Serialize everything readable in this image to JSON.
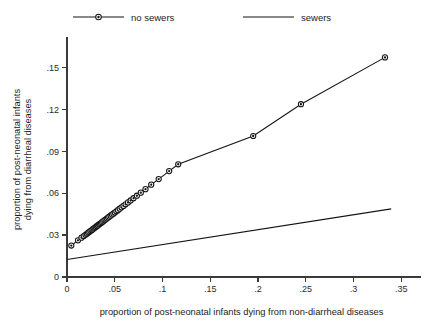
{
  "chart_data": {
    "type": "scatter",
    "title": "",
    "xlabel": "proportion of post-neonatal infants dying from non-diarrheal diseases",
    "ylabel_line1": "proportion of post-neonatal infants",
    "ylabel_line2": "dying from diarrheal diseases",
    "xlim": [
      0,
      0.355
    ],
    "ylim": [
      0,
      0.168
    ],
    "grid": false,
    "legend_position": "top",
    "xticks": [
      0,
      0.05,
      0.1,
      0.15,
      0.2,
      0.25,
      0.3,
      0.35
    ],
    "xtick_labels": [
      "0",
      ".05",
      ".1",
      ".15",
      ".2",
      ".25",
      ".3",
      ".35"
    ],
    "yticks": [
      0,
      0.03,
      0.06,
      0.09,
      0.12,
      0.15
    ],
    "ytick_labels": [
      "0",
      ".03",
      ".06",
      ".09",
      ".12",
      ".15"
    ],
    "series": [
      {
        "name": "no sewers",
        "marker": "circle-dot",
        "line": true,
        "color": "#141414",
        "points": [
          [
            0.0045,
            0.0225
          ],
          [
            0.0115,
            0.0262
          ],
          [
            0.0152,
            0.0281
          ],
          [
            0.0176,
            0.0293
          ],
          [
            0.0194,
            0.0302
          ],
          [
            0.0208,
            0.0309
          ],
          [
            0.0221,
            0.0316
          ],
          [
            0.0233,
            0.0322
          ],
          [
            0.0245,
            0.0328
          ],
          [
            0.0257,
            0.0334
          ],
          [
            0.0268,
            0.034
          ],
          [
            0.0279,
            0.0346
          ],
          [
            0.029,
            0.0352
          ],
          [
            0.0301,
            0.0357
          ],
          [
            0.0312,
            0.0363
          ],
          [
            0.0323,
            0.0369
          ],
          [
            0.0334,
            0.0375
          ],
          [
            0.0345,
            0.038
          ],
          [
            0.0356,
            0.0386
          ],
          [
            0.0368,
            0.0392
          ],
          [
            0.038,
            0.0398
          ],
          [
            0.0392,
            0.0405
          ],
          [
            0.0404,
            0.0411
          ],
          [
            0.0417,
            0.0418
          ],
          [
            0.043,
            0.0425
          ],
          [
            0.0443,
            0.0431
          ],
          [
            0.0457,
            0.0438
          ],
          [
            0.0471,
            0.0446
          ],
          [
            0.0486,
            0.0453
          ],
          [
            0.0501,
            0.0461
          ],
          [
            0.0517,
            0.047
          ],
          [
            0.0534,
            0.0478
          ],
          [
            0.0552,
            0.0488
          ],
          [
            0.0571,
            0.0498
          ],
          [
            0.0592,
            0.0508
          ],
          [
            0.0614,
            0.052
          ],
          [
            0.0639,
            0.0533
          ],
          [
            0.0666,
            0.0547
          ],
          [
            0.0697,
            0.0563
          ],
          [
            0.0732,
            0.0581
          ],
          [
            0.0773,
            0.0603
          ],
          [
            0.0822,
            0.0628
          ],
          [
            0.0882,
            0.066
          ],
          [
            0.096,
            0.07
          ],
          [
            0.107,
            0.0757
          ],
          [
            0.1165,
            0.0806
          ],
          [
            0.195,
            0.1008
          ],
          [
            0.245,
            0.1235
          ],
          [
            0.333,
            0.157
          ]
        ]
      },
      {
        "name": "sewers",
        "marker": "none",
        "line": true,
        "color": "#141414",
        "points": [
          [
            0.0,
            0.0125
          ],
          [
            0.3395,
            0.0487
          ]
        ]
      }
    ]
  },
  "legend": {
    "entries": [
      {
        "label": "no sewers",
        "marker": "circle-dot"
      },
      {
        "label": "sewers",
        "marker": "none"
      }
    ]
  }
}
